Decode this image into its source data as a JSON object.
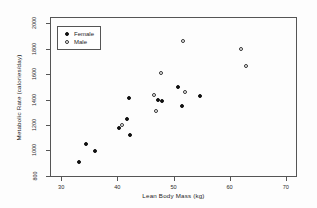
{
  "chart_data": {
    "type": "scatter",
    "title": "",
    "xlabel": "Lean Body Mass (kg)",
    "ylabel": "Metabolic Rate (calories/day)",
    "xlim": [
      28,
      72
    ],
    "ylim": [
      790,
      2050
    ],
    "xticks": [
      30,
      40,
      50,
      60,
      70
    ],
    "yticks": [
      800,
      1000,
      1200,
      1400,
      1600,
      1800,
      2000
    ],
    "grid": false,
    "legend_position": "top-left",
    "series": [
      {
        "name": "Female",
        "marker": "filled-circle",
        "color": "#111111",
        "points": [
          {
            "x": 33.1,
            "y": 912
          },
          {
            "x": 34.5,
            "y": 1051
          },
          {
            "x": 36.1,
            "y": 998
          },
          {
            "x": 40.3,
            "y": 1178
          },
          {
            "x": 41.7,
            "y": 1244
          },
          {
            "x": 42.0,
            "y": 1414
          },
          {
            "x": 42.3,
            "y": 1121
          },
          {
            "x": 48.0,
            "y": 1392
          },
          {
            "x": 50.8,
            "y": 1502
          },
          {
            "x": 51.5,
            "y": 1348
          },
          {
            "x": 54.7,
            "y": 1425
          },
          {
            "x": 47.2,
            "y": 1398
          }
        ]
      },
      {
        "name": "Male",
        "marker": "open-circle",
        "color": "#333333",
        "points": [
          {
            "x": 40.8,
            "y": 1196
          },
          {
            "x": 46.5,
            "y": 1434
          },
          {
            "x": 46.9,
            "y": 1313
          },
          {
            "x": 47.8,
            "y": 1607
          },
          {
            "x": 51.7,
            "y": 1861
          },
          {
            "x": 52.1,
            "y": 1460
          },
          {
            "x": 62.1,
            "y": 1795
          },
          {
            "x": 62.9,
            "y": 1668
          }
        ]
      }
    ]
  },
  "legend": {
    "entries": [
      {
        "label": "Female",
        "marker": "filled-circle"
      },
      {
        "label": "Male",
        "marker": "open-circle"
      }
    ]
  }
}
